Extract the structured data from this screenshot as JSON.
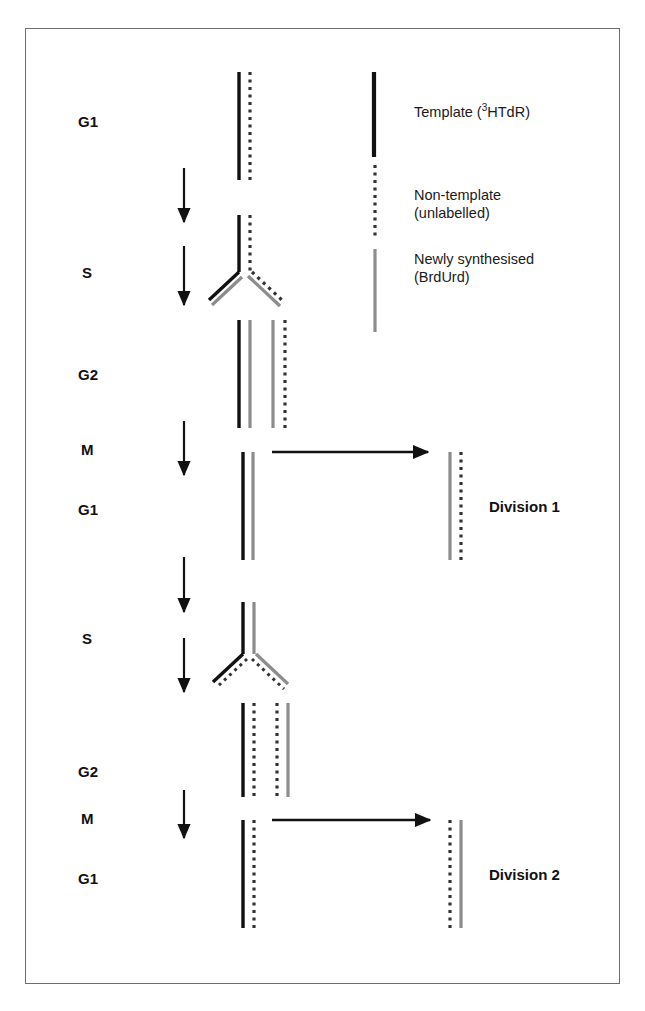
{
  "figure": {
    "background": "#ffffff",
    "border_color": "#6e6e6e",
    "width": 645,
    "height": 1011
  },
  "colors": {
    "template_black": "#111111",
    "newly_synthesised_gray": "#8c8c8c",
    "non_template_dotted": "#333333",
    "arrow": "#111111",
    "text": "#111111"
  },
  "stage_labels": [
    {
      "id": "g1-first",
      "text": "G1",
      "x": 78,
      "y": 113
    },
    {
      "id": "s-first",
      "text": "S",
      "x": 82,
      "y": 264
    },
    {
      "id": "g2-first",
      "text": "G2",
      "x": 78,
      "y": 366
    },
    {
      "id": "m-first",
      "text": "M",
      "x": 81,
      "y": 441
    },
    {
      "id": "g1-second",
      "text": "G1",
      "x": 78,
      "y": 501
    },
    {
      "id": "s-second",
      "text": "S",
      "x": 82,
      "y": 630
    },
    {
      "id": "g2-second",
      "text": "G2",
      "x": 78,
      "y": 763
    },
    {
      "id": "m-second",
      "text": "M",
      "x": 81,
      "y": 810
    },
    {
      "id": "g1-third",
      "text": "G1",
      "x": 78,
      "y": 870
    }
  ],
  "division_labels": [
    {
      "id": "division-1",
      "text": "Division 1",
      "x": 489,
      "y": 498
    },
    {
      "id": "division-2",
      "text": "Division 2",
      "x": 489,
      "y": 866
    }
  ],
  "legend": {
    "items": [
      {
        "id": "template",
        "strand_type": "solid-black",
        "lines": [
          "Template (³HTdR)"
        ],
        "label_html": "Template (<sup>3</sup>HTdR)",
        "swatch": {
          "x": 374,
          "y": 72,
          "height": 85
        },
        "text": {
          "x": 414,
          "y": 103
        },
        "align": "left"
      },
      {
        "id": "non-template",
        "strand_type": "dotted-black",
        "lines": [
          "Non-template",
          "(unlabelled)"
        ],
        "label_html": "Non-template<br>(unlabelled)",
        "swatch": {
          "x": 375,
          "y": 165,
          "height": 75
        },
        "text": {
          "x": 414,
          "y": 186
        },
        "align": "left"
      },
      {
        "id": "newly-synthesised",
        "strand_type": "solid-gray",
        "lines": [
          "Newly synthesised",
          "(BrdUrd)"
        ],
        "label_html": "Newly synthesised<br>(BrdUrd)",
        "swatch": {
          "x": 375,
          "y": 249,
          "height": 83
        },
        "text": {
          "x": 414,
          "y": 250
        },
        "align": "left"
      }
    ]
  },
  "vertical_arrows": [
    {
      "id": "arrow-g1-to-s-1",
      "x": 184,
      "y1": 168,
      "y2": 222
    },
    {
      "id": "arrow-s-to-g2-1",
      "x": 184,
      "y1": 246,
      "y2": 305
    },
    {
      "id": "arrow-g2-to-m-1",
      "x": 184,
      "y1": 421,
      "y2": 475
    },
    {
      "id": "arrow-g1-to-s-2",
      "x": 184,
      "y1": 557,
      "y2": 612
    },
    {
      "id": "arrow-s-to-g2-2",
      "x": 184,
      "y1": 638,
      "y2": 692
    },
    {
      "id": "arrow-g2-to-m-2",
      "x": 184,
      "y1": 790,
      "y2": 838
    }
  ],
  "division_arrows": [
    {
      "id": "division-arrow-1",
      "x1": 272,
      "x2": 428,
      "y": 452
    },
    {
      "id": "division-arrow-2",
      "x1": 272,
      "x2": 430,
      "y": 820
    }
  ],
  "dna_groups": [
    {
      "id": "g1-first-dna",
      "stage": "G1",
      "description": "Parental DNA: one tritiated template strand and one unlabelled non-template strand",
      "strands": [
        {
          "type": "solid-black",
          "x": 239,
          "y1": 72,
          "y2": 180
        },
        {
          "type": "dotted",
          "x": 250,
          "y1": 72,
          "y2": 180
        }
      ]
    },
    {
      "id": "s-first-fork",
      "stage": "S",
      "description": "Replication fork: black template and dotted non-template separate, each templating a grey BrdUrd strand",
      "stem": [
        {
          "type": "solid-black",
          "x": 239,
          "y1": 215,
          "y2": 272
        },
        {
          "type": "dotted",
          "x": 250,
          "y1": 215,
          "y2": 272
        }
      ],
      "left_arm": [
        {
          "type": "solid-black",
          "x1": 239,
          "y1": 272,
          "x2": 209,
          "y2": 300
        },
        {
          "type": "solid-gray",
          "x1": 242,
          "y1": 277,
          "x2": 212,
          "y2": 305
        }
      ],
      "right_arm": [
        {
          "type": "dotted",
          "x1": 252,
          "y1": 272,
          "x2": 284,
          "y2": 302
        },
        {
          "type": "solid-gray",
          "x1": 248,
          "y1": 276,
          "x2": 280,
          "y2": 306
        }
      ]
    },
    {
      "id": "g2-first-dna",
      "stage": "G2",
      "description": "Two sister chromatids: black+grey and grey+dotted",
      "strands": [
        {
          "type": "solid-black",
          "x": 239,
          "y1": 320,
          "y2": 428
        },
        {
          "type": "solid-gray",
          "x": 250,
          "y1": 320,
          "y2": 428
        },
        {
          "type": "solid-gray",
          "x": 273,
          "y1": 320,
          "y2": 428
        },
        {
          "type": "dotted",
          "x": 285,
          "y1": 320,
          "y2": 428
        }
      ]
    },
    {
      "id": "g1-second-dna-left",
      "stage": "G1",
      "description": "Daughter cell retaining the tritiated template strand",
      "strands": [
        {
          "type": "solid-black",
          "x": 243,
          "y1": 452,
          "y2": 560
        },
        {
          "type": "solid-gray",
          "x": 253,
          "y1": 452,
          "y2": 560
        }
      ]
    },
    {
      "id": "g1-second-dna-right",
      "stage": "G1",
      "description": "Daughter cell after Division 1 containing grey BrdUrd and dotted strands",
      "strands": [
        {
          "type": "solid-gray",
          "x": 450,
          "y1": 452,
          "y2": 560
        },
        {
          "type": "dotted",
          "x": 461,
          "y1": 452,
          "y2": 560
        }
      ]
    },
    {
      "id": "s-second-fork",
      "stage": "S",
      "description": "Second replication fork from the black+grey chromatid",
      "stem": [
        {
          "type": "solid-black",
          "x": 243,
          "y1": 602,
          "y2": 654
        },
        {
          "type": "solid-gray",
          "x": 254,
          "y1": 602,
          "y2": 654
        }
      ],
      "left_arm": [
        {
          "type": "solid-black",
          "x1": 243,
          "y1": 654,
          "x2": 213,
          "y2": 682
        },
        {
          "type": "dotted-diag",
          "x1": 247,
          "y1": 659,
          "x2": 217,
          "y2": 687
        }
      ],
      "right_arm": [
        {
          "type": "solid-gray",
          "x1": 256,
          "y1": 654,
          "x2": 288,
          "y2": 684
        },
        {
          "type": "dotted-diag",
          "x1": 252,
          "y1": 659,
          "x2": 284,
          "y2": 689
        }
      ]
    },
    {
      "id": "g2-second-dna",
      "stage": "G2",
      "description": "Second G2: black+dotted and dotted+grey chromatids",
      "strands": [
        {
          "type": "solid-black",
          "x": 243,
          "y1": 703,
          "y2": 797
        },
        {
          "type": "dotted",
          "x": 254,
          "y1": 703,
          "y2": 797
        },
        {
          "type": "dotted",
          "x": 277,
          "y1": 703,
          "y2": 797
        },
        {
          "type": "solid-gray",
          "x": 288,
          "y1": 703,
          "y2": 797
        }
      ]
    },
    {
      "id": "g1-third-dna-left",
      "stage": "G1",
      "description": "Daughter cell after Division 2 still carrying the tritiated template strand",
      "strands": [
        {
          "type": "solid-black",
          "x": 243,
          "y1": 820,
          "y2": 928
        },
        {
          "type": "dotted",
          "x": 254,
          "y1": 820,
          "y2": 928
        }
      ]
    },
    {
      "id": "g1-third-dna-right",
      "stage": "G1",
      "description": "Daughter cell after Division 2 with dotted and grey strands only",
      "strands": [
        {
          "type": "dotted",
          "x": 450,
          "y1": 820,
          "y2": 928
        },
        {
          "type": "solid-gray",
          "x": 461,
          "y1": 820,
          "y2": 928
        }
      ]
    }
  ]
}
